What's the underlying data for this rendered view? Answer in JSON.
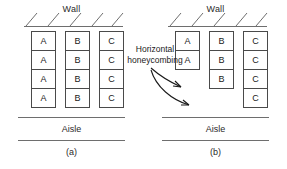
{
  "figure": {
    "annotation": "Horizontal honeycombing",
    "panels": [
      {
        "id": "a",
        "caption": "(a)",
        "wall_label": "Wall",
        "aisle_label": "Aisle",
        "columns": [
          {
            "letter": "A",
            "count": 4,
            "boxes": [
              "A",
              "A",
              "A",
              "A"
            ]
          },
          {
            "letter": "B",
            "count": 4,
            "boxes": [
              "B",
              "B",
              "B",
              "B"
            ]
          },
          {
            "letter": "C",
            "count": 4,
            "boxes": [
              "C",
              "C",
              "C",
              "C"
            ]
          }
        ]
      },
      {
        "id": "b",
        "caption": "(b)",
        "wall_label": "Wall",
        "aisle_label": "Aisle",
        "columns": [
          {
            "letter": "A",
            "count": 2,
            "boxes": [
              "A",
              "A"
            ]
          },
          {
            "letter": "B",
            "count": 3,
            "boxes": [
              "B",
              "B",
              "B"
            ]
          },
          {
            "letter": "C",
            "count": 4,
            "boxes": [
              "C",
              "C",
              "C",
              "C"
            ]
          }
        ]
      }
    ],
    "colors": {
      "line": "#6e6e6e",
      "box_border": "#4a4a4a",
      "text": "#1a1a1a",
      "background": "#ffffff"
    }
  }
}
